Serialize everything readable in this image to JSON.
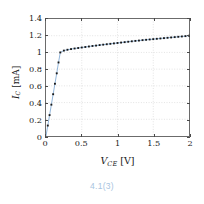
{
  "figure": {
    "caption": "4.1(3)",
    "caption_color": "#a8c4e0"
  },
  "chart_data": {
    "type": "line",
    "title": "",
    "subtitle": "",
    "xlabel": "V_CE [V]",
    "xlabel_symbol": "V",
    "xlabel_subscript": "CE",
    "xlabel_unit": "[V]",
    "ylabel": "I_C [mA]",
    "ylabel_symbol": "I",
    "ylabel_subscript": "C",
    "ylabel_unit": "[mA]",
    "xlim": [
      0,
      2
    ],
    "ylim": [
      0,
      1.4
    ],
    "xticks": [
      0,
      0.5,
      1,
      1.5,
      2
    ],
    "xtick_labels": [
      "0",
      "0.5",
      "1",
      "1.5",
      "2"
    ],
    "yticks": [
      0,
      0.2,
      0.4,
      0.6,
      0.8,
      1,
      1.2,
      1.4
    ],
    "ytick_labels": [
      "0",
      "0.2",
      "0.4",
      "0.6",
      "0.8",
      "1",
      "1.2",
      "1.4"
    ],
    "grid": true,
    "grid_style": "dotted",
    "grid_color": "#cfcfcf",
    "legend": null,
    "line_color": "#8fb4d9",
    "marker_color": "#1a1a1a",
    "marker": "square",
    "series": [
      {
        "name": "Ic vs Vce",
        "x": [
          0.0,
          0.025,
          0.05,
          0.075,
          0.1,
          0.125,
          0.15,
          0.175,
          0.2,
          0.25,
          0.3,
          0.35,
          0.4,
          0.45,
          0.5,
          0.55,
          0.6,
          0.65,
          0.7,
          0.75,
          0.8,
          0.85,
          0.9,
          0.95,
          1.0,
          1.05,
          1.1,
          1.15,
          1.2,
          1.25,
          1.3,
          1.35,
          1.4,
          1.45,
          1.5,
          1.55,
          1.6,
          1.65,
          1.7,
          1.75,
          1.8,
          1.85,
          1.9,
          1.95,
          2.0
        ],
        "y": [
          0.0,
          0.125,
          0.25,
          0.375,
          0.5,
          0.625,
          0.75,
          0.88,
          1.0,
          1.022,
          1.032,
          1.04,
          1.047,
          1.053,
          1.059,
          1.065,
          1.071,
          1.077,
          1.082,
          1.088,
          1.093,
          1.098,
          1.103,
          1.108,
          1.113,
          1.118,
          1.123,
          1.128,
          1.133,
          1.138,
          1.142,
          1.147,
          1.151,
          1.155,
          1.159,
          1.163,
          1.167,
          1.171,
          1.175,
          1.179,
          1.183,
          1.187,
          1.191,
          1.195,
          1.2
        ]
      }
    ],
    "annotations": []
  }
}
